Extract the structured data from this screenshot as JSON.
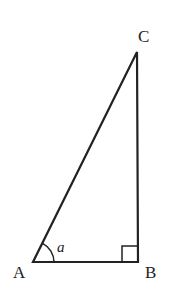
{
  "diagram": {
    "type": "right-triangle",
    "vertices": {
      "A": {
        "label": "A",
        "x": 33,
        "y": 262
      },
      "B": {
        "label": "B",
        "x": 138,
        "y": 262
      },
      "C": {
        "label": "C",
        "x": 137,
        "y": 52
      }
    },
    "angle_label": "a",
    "right_angle_at": "B",
    "stroke_color": "#222222"
  }
}
